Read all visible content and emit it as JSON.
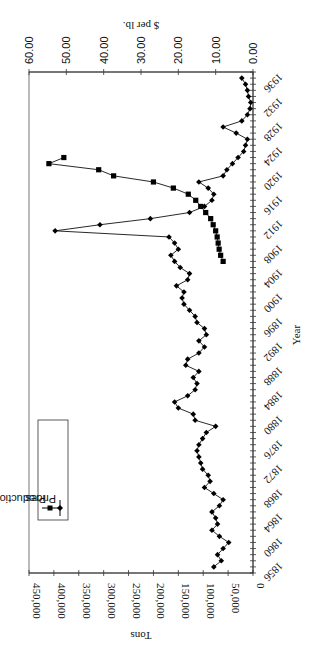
{
  "chart_data": {
    "type": "line",
    "orientation": "rotated-180-portrait (chart rendered rotated 90° counter-clockwise / upside down)",
    "xlabel": "Year",
    "ylabel_left": "Tons",
    "ylabel_right": "$ per lb.",
    "x_ticks": [
      "1856",
      "1860",
      "1864",
      "1868",
      "1872",
      "1876",
      "1880",
      "1884",
      "1888",
      "1892",
      "1896",
      "1900",
      "1904",
      "1908",
      "1912",
      "1916",
      "1920",
      "1924",
      "1928",
      "1932",
      "1936"
    ],
    "tons_ticks": [
      "0",
      "50,000",
      "100,000",
      "150,000",
      "200,000",
      "250,000",
      "300,000",
      "350,000",
      "400,000",
      "450,000"
    ],
    "price_ticks": [
      "0.00",
      "10.00",
      "20.00",
      "30.00",
      "40.00",
      "50.00",
      "60.00"
    ],
    "tons_range": [
      0,
      450000
    ],
    "price_range": [
      0,
      60
    ],
    "year_range": [
      1856,
      1938
    ],
    "grid": false,
    "legend": [
      "Production",
      "Prices"
    ],
    "legend_position": "inside-upper-left",
    "series": [
      {
        "name": "Production",
        "axis": "tons",
        "marker": "square",
        "x": [
          1907,
          1908,
          1909,
          1910,
          1911,
          1912,
          1913,
          1914,
          1915,
          1916,
          1917,
          1918,
          1919,
          1920,
          1921,
          1922,
          1923,
          1924
        ],
        "values": [
          60000,
          65000,
          68000,
          70000,
          72000,
          75000,
          80000,
          85000,
          95000,
          105000,
          115000,
          130000,
          160000,
          200000,
          280000,
          310000,
          410000,
          380000
        ]
      },
      {
        "name": "Prices",
        "axis": "price",
        "marker": "diamond",
        "x": [
          1857,
          1858,
          1859,
          1860,
          1861,
          1862,
          1863,
          1864,
          1865,
          1866,
          1867,
          1868,
          1869,
          1870,
          1871,
          1872,
          1873,
          1874,
          1875,
          1876,
          1877,
          1878,
          1879,
          1880,
          1881,
          1882,
          1883,
          1884,
          1885,
          1886,
          1887,
          1888,
          1889,
          1890,
          1891,
          1892,
          1893,
          1894,
          1895,
          1896,
          1897,
          1898,
          1899,
          1900,
          1901,
          1902,
          1903,
          1904,
          1905,
          1906,
          1907,
          1908,
          1909,
          1910,
          1911,
          1912,
          1913,
          1914,
          1915,
          1916,
          1917,
          1918,
          1919,
          1920,
          1921,
          1922,
          1923,
          1924,
          1925,
          1926,
          1927,
          1928,
          1929,
          1930,
          1931,
          1932,
          1933,
          1934,
          1935,
          1936,
          1937
        ],
        "values": [
          10.5,
          8.5,
          9.5,
          8.0,
          6.5,
          9.0,
          11.0,
          9.5,
          10.0,
          11.0,
          9.0,
          8.0,
          10.5,
          13.0,
          11.5,
          12.0,
          13.5,
          14.0,
          14.5,
          15.0,
          14.5,
          13.5,
          12.5,
          10.0,
          15.5,
          16.0,
          20.0,
          21.0,
          17.5,
          15.5,
          15.0,
          16.0,
          14.5,
          18.0,
          17.5,
          14.5,
          13.0,
          14.5,
          12.5,
          13.0,
          15.0,
          15.5,
          17.0,
          18.5,
          19.0,
          18.5,
          20.5,
          17.5,
          17.0,
          19.5,
          21.0,
          22.0,
          20.0,
          21.0,
          22.5,
          53.0,
          41.0,
          27.5,
          17.0,
          13.0,
          11.0,
          10.5,
          12.0,
          14.5,
          8.0,
          7.0,
          5.5,
          4.0,
          2.5,
          2.0,
          1.5,
          4.5,
          8.0,
          3.0,
          1.5,
          0.8,
          0.6,
          1.2,
          1.5,
          2.0,
          3.0
        ]
      }
    ]
  }
}
